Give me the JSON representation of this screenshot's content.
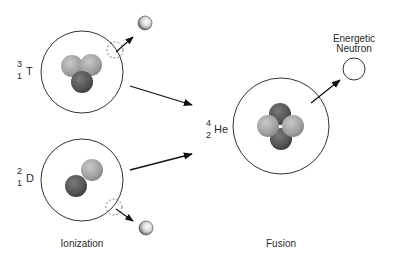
{
  "diagram": {
    "captions": {
      "left": "Ionization",
      "right": "Fusion"
    },
    "tritium": {
      "mass_number": "3",
      "atomic_number": "1",
      "symbol": "T"
    },
    "deuterium": {
      "mass_number": "2",
      "atomic_number": "1",
      "symbol": "D"
    },
    "helium": {
      "mass_number": "4",
      "atomic_number": "2",
      "symbol": "He"
    },
    "neutron": {
      "label_line1": "Energetic",
      "label_line2": "Neutron"
    },
    "colors": {
      "proton": "#a8a8a8",
      "neutron_particle": "#5a5a5a",
      "outline": "#333333"
    }
  }
}
